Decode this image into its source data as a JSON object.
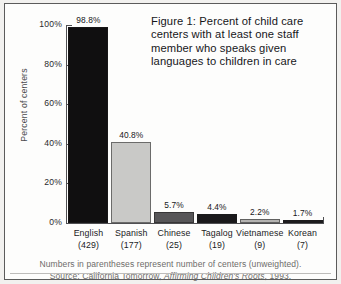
{
  "figure": {
    "title": "Figure 1: Percent of child care centers with at least one staff member who speaks given languages to children in care",
    "footnote_1": "Numbers in parentheses represent number of centers (unweighted).",
    "source_prefix": "Source: California Tomorrow, ",
    "source_italic": "Affirming Children's Roots",
    "source_suffix": ", 1993."
  },
  "chart_data": {
    "type": "bar",
    "title": "Figure 1: Percent of child care centers with at least one staff member who speaks given languages to children in care",
    "xlabel": "",
    "ylabel": "Percent of centers",
    "categories": [
      "English",
      "Spanish",
      "Chinese",
      "Tagalog",
      "Vietnamese",
      "Korean"
    ],
    "counts": [
      429,
      177,
      25,
      19,
      9,
      7
    ],
    "category_sublabels": [
      "(429)",
      "(177)",
      "(25)",
      "(19)",
      "(9)",
      "(7)"
    ],
    "values": [
      98.8,
      40.8,
      5.7,
      4.4,
      2.2,
      1.7
    ],
    "value_labels": [
      "98.8%",
      "40.8%",
      "5.7%",
      "4.4%",
      "2.2%",
      "1.7%"
    ],
    "bar_colors": [
      "#100f10",
      "#c9c9c7",
      "#575658",
      "#1a191b",
      "#b4b3b1",
      "#1d1c1e"
    ],
    "ylim": [
      0,
      100
    ],
    "yticks": [
      0,
      20,
      40,
      60,
      80,
      100
    ],
    "ytick_labels": [
      "0%",
      "20%",
      "40%",
      "60%",
      "80%",
      "100%"
    ],
    "grid": false,
    "legend": "none"
  },
  "colors": {
    "axis": "#4f4f52",
    "frame": "#5b5b5b",
    "page": "#fdfdfc",
    "footnote_text": "#6d6c6a"
  }
}
